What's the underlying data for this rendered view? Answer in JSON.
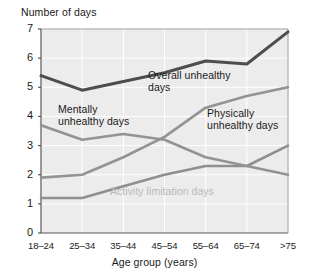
{
  "chart_data": {
    "type": "line",
    "title": "",
    "ylabel": "Number of days",
    "xlabel": "Age group (years)",
    "categories": [
      "18–24",
      "25–34",
      "35–44",
      "45–54",
      "55–64",
      "65–74",
      ">75"
    ],
    "ylim": [
      0,
      7
    ],
    "yticks": [
      0,
      1,
      2,
      3,
      4,
      5,
      6,
      7
    ],
    "grid": true,
    "legend_position": "inline-annotations",
    "series": [
      {
        "name": "Overall unhealthy days",
        "color": "#4d4d4d",
        "values": [
          5.4,
          4.9,
          5.2,
          5.5,
          5.9,
          5.8,
          6.9
        ]
      },
      {
        "name": "Mentally unhealthy days",
        "color": "#939393",
        "values": [
          3.7,
          3.2,
          3.4,
          3.2,
          2.6,
          2.3,
          2.0
        ]
      },
      {
        "name": "Physically unhealthy days",
        "color": "#939393",
        "values": [
          1.9,
          2.0,
          2.6,
          3.3,
          4.3,
          4.7,
          5.0
        ]
      },
      {
        "name": "Activity limitation days",
        "color": "#8f8f8f",
        "values": [
          1.2,
          1.2,
          1.6,
          2.0,
          2.3,
          2.3,
          3.0
        ]
      }
    ],
    "annotations": [
      {
        "text": "Overall unhealthy",
        "text2": "days",
        "series": "Overall unhealthy days",
        "color": "#1a1a1a"
      },
      {
        "text": "Mentally",
        "text2": "unhealthy days",
        "series": "Mentally unhealthy days",
        "color": "#1a1a1a"
      },
      {
        "text": "Physically",
        "text2": "unhealthy days",
        "series": "Physically unhealthy days",
        "color": "#1a1a1a"
      },
      {
        "text": "Activity limitation days",
        "text2": "",
        "series": "Activity limitation days",
        "color": "#b9b9b9"
      }
    ],
    "plot_background": "#ececec"
  }
}
